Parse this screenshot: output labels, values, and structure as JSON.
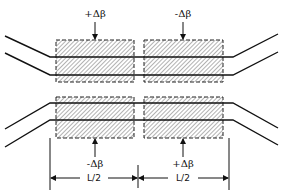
{
  "diagram": {
    "top": {
      "left_section_label": "+Δβ",
      "right_section_label": "-Δβ"
    },
    "bottom": {
      "left_section_label": "-Δβ",
      "right_section_label": "+Δβ"
    },
    "dimensions": {
      "left_length_label": "L/2",
      "right_length_label": "L/2"
    },
    "colors": {
      "line": "#111111",
      "hatch": "#555555",
      "background": "#ffffff"
    }
  }
}
